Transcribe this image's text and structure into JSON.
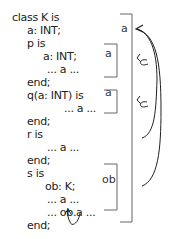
{
  "code": {
    "lines": [
      {
        "text": "class K is",
        "x": 12,
        "y": 11
      },
      {
        "text": "a: INT;",
        "x": 27,
        "y": 24
      },
      {
        "text": "p is",
        "x": 27,
        "y": 37
      },
      {
        "text": "a: INT;",
        "x": 43,
        "y": 50
      },
      {
        "text": "... a ...",
        "x": 47,
        "y": 63
      },
      {
        "text": "end;",
        "x": 27,
        "y": 76
      },
      {
        "text": "q(a: INT) is",
        "x": 27,
        "y": 89
      },
      {
        "text": "... a ...",
        "x": 64,
        "y": 102
      },
      {
        "text": "end;",
        "x": 27,
        "y": 115
      },
      {
        "text": "r is",
        "x": 27,
        "y": 128
      },
      {
        "text": "... a ...",
        "x": 47,
        "y": 141
      },
      {
        "text": "end;",
        "x": 27,
        "y": 154
      },
      {
        "text": "s is",
        "x": 27,
        "y": 167
      },
      {
        "text": "ob: K;",
        "x": 45,
        "y": 180
      },
      {
        "text": "... a ...",
        "x": 47,
        "y": 193
      },
      {
        "text": "... ob.a ...",
        "x": 47,
        "y": 206
      },
      {
        "text": "end;",
        "x": 27,
        "y": 219
      }
    ],
    "final_line": {
      "prefix": "end; -- ",
      "class_name": "K"
    }
  },
  "scopes": {
    "class_scope_label": "a",
    "p_scope_label": "a",
    "q_scope_label": "a",
    "s_scope_label": "ob"
  },
  "colors": {
    "bracket": "#666666",
    "arrow": "#222222"
  }
}
